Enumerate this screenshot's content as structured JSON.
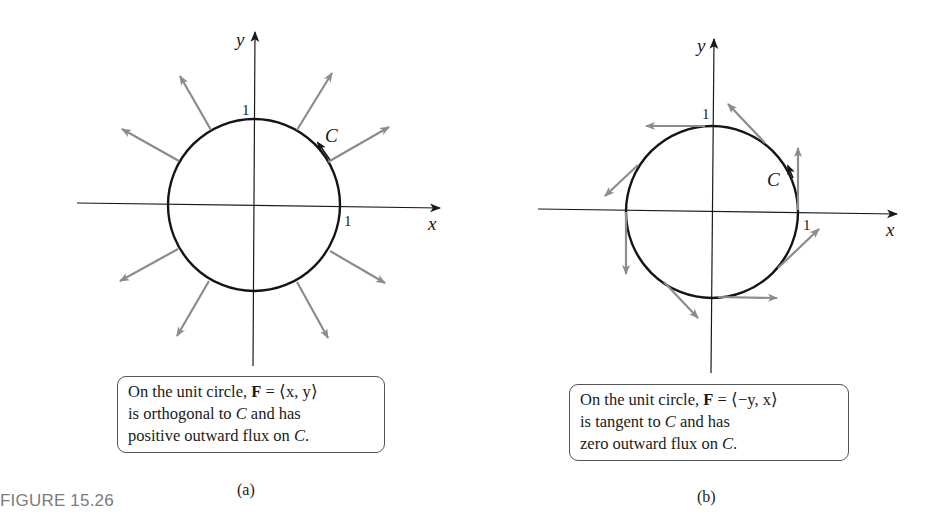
{
  "figure": {
    "title": "FIGURE 15.26"
  },
  "panels": [
    {
      "id": "a",
      "sublabel": "(a)",
      "axis_labels": {
        "x": "x",
        "y": "y"
      },
      "tick_labels": {
        "x_one": "1",
        "y_one": "1"
      },
      "curve_label": "C",
      "caption": {
        "line1_pre": "On the unit circle, ",
        "line1_bold": "F",
        "line1_post": " = ⟨x, y⟩",
        "line2_pre": "is orthogonal to ",
        "line2_ital": "C",
        "line2_post": " and has",
        "line3_pre": "positive outward flux on ",
        "line3_ital": "C",
        "line3_post": "."
      },
      "vector_field": "⟨x, y⟩",
      "arrow_style": "radial",
      "arrow_angles_deg": [
        30,
        60,
        120,
        150,
        210,
        240,
        300,
        330
      ]
    },
    {
      "id": "b",
      "sublabel": "(b)",
      "axis_labels": {
        "x": "x",
        "y": "y"
      },
      "tick_labels": {
        "x_one": "1",
        "y_one": "1"
      },
      "curve_label": "C",
      "caption": {
        "line1_pre": "On the unit circle, ",
        "line1_bold": "F",
        "line1_post": " = ⟨−y, x⟩",
        "line2_pre": "is tangent to ",
        "line2_ital": "C",
        "line2_post": " and has",
        "line3_pre": "zero outward flux on ",
        "line3_ital": "C",
        "line3_post": "."
      },
      "vector_field": "⟨−y, x⟩",
      "arrow_style": "tangent",
      "arrow_angles_deg": [
        0,
        45,
        90,
        135,
        180,
        225,
        270,
        315
      ]
    }
  ],
  "colors": {
    "curve": "#151515",
    "axis": "#1a1a1a",
    "arrow": "#8c8c8c",
    "caption_border": "#555555",
    "figure_title": "#7a7a7a"
  }
}
